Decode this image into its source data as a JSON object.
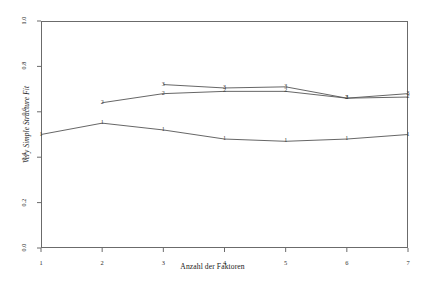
{
  "chart_data": {
    "type": "line",
    "title": "",
    "subtitle": "",
    "xlabel": "Anzahl der Faktoren",
    "ylabel": "Very Simple Structure Fit",
    "x": [
      1,
      2,
      3,
      4,
      5,
      6,
      7
    ],
    "xtick_labels": [
      "1",
      "2",
      "3",
      "4",
      "5",
      "6",
      "7"
    ],
    "ytick_labels": [
      "0.0",
      "0.2",
      "0.4",
      "0.6",
      "0.8",
      "1.0"
    ],
    "ytick_values": [
      0.0,
      0.2,
      0.4,
      0.6,
      0.8,
      1.0
    ],
    "xlim": [
      1,
      7
    ],
    "ylim": [
      0.0,
      1.0
    ],
    "grid": false,
    "legend": "none",
    "point_marker_style": "digit-of-series-name",
    "line_color": "#555555",
    "axis_color": "#6b6b6b",
    "series": [
      {
        "name": "1",
        "marker": "1",
        "x": [
          1,
          2,
          3,
          4,
          5,
          6,
          7
        ],
        "values": [
          0.5,
          0.55,
          0.52,
          0.48,
          0.47,
          0.48,
          0.5
        ]
      },
      {
        "name": "2",
        "marker": "2",
        "x": [
          2,
          3,
          4,
          5,
          6,
          7
        ],
        "values": [
          0.64,
          0.68,
          0.69,
          0.69,
          0.66,
          0.665
        ]
      },
      {
        "name": "3",
        "marker": "3",
        "x": [
          3,
          4,
          5,
          6,
          7
        ],
        "values": [
          0.72,
          0.705,
          0.71,
          0.66,
          0.68
        ]
      }
    ]
  }
}
